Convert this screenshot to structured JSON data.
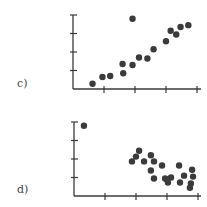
{
  "chart_data": [
    {
      "type": "scatter",
      "panel_label": "c)",
      "title": "",
      "xlabel": "",
      "ylabel": "",
      "grid": false,
      "legend": null,
      "xlim": [
        0,
        4
      ],
      "ylim": [
        0,
        4
      ],
      "x_ticks": [
        1,
        2,
        3,
        4
      ],
      "y_ticks": [
        1,
        2,
        3,
        4
      ],
      "tick_labels_shown": false,
      "points": [
        {
          "x": 0.63,
          "y": 0.28
        },
        {
          "x": 0.95,
          "y": 0.65
        },
        {
          "x": 1.2,
          "y": 0.7
        },
        {
          "x": 1.6,
          "y": 1.35
        },
        {
          "x": 1.62,
          "y": 0.85
        },
        {
          "x": 1.92,
          "y": 1.3
        },
        {
          "x": 1.92,
          "y": 3.8
        },
        {
          "x": 2.13,
          "y": 1.7
        },
        {
          "x": 2.4,
          "y": 1.65
        },
        {
          "x": 2.6,
          "y": 2.15
        },
        {
          "x": 3.0,
          "y": 2.58
        },
        {
          "x": 3.15,
          "y": 3.15
        },
        {
          "x": 3.33,
          "y": 2.95
        },
        {
          "x": 3.47,
          "y": 3.35
        },
        {
          "x": 3.72,
          "y": 3.45
        }
      ],
      "layout": {
        "origin_px": [
          73,
          89
        ],
        "x_unit_px": 31,
        "y_unit_px": 18.5,
        "x_end_px": 201
      }
    },
    {
      "type": "scatter",
      "panel_label": "d)",
      "title": "",
      "xlabel": "",
      "ylabel": "",
      "grid": false,
      "legend": null,
      "xlim": [
        0,
        4
      ],
      "ylim": [
        0,
        4
      ],
      "x_ticks": [
        1,
        2,
        3,
        4
      ],
      "y_ticks": [
        1,
        2,
        3,
        4
      ],
      "tick_labels_shown": false,
      "points": [
        {
          "x": 0.32,
          "y": 3.8
        },
        {
          "x": 1.87,
          "y": 1.87
        },
        {
          "x": 2.0,
          "y": 2.13
        },
        {
          "x": 2.1,
          "y": 2.45
        },
        {
          "x": 2.26,
          "y": 1.87
        },
        {
          "x": 2.48,
          "y": 2.2
        },
        {
          "x": 2.58,
          "y": 1.87
        },
        {
          "x": 2.48,
          "y": 1.38
        },
        {
          "x": 2.58,
          "y": 0.95
        },
        {
          "x": 2.84,
          "y": 1.65
        },
        {
          "x": 2.94,
          "y": 0.95
        },
        {
          "x": 3.03,
          "y": 0.73
        },
        {
          "x": 3.13,
          "y": 1.0
        },
        {
          "x": 3.0,
          "y": 0.9
        },
        {
          "x": 3.39,
          "y": 1.65
        },
        {
          "x": 3.42,
          "y": 0.73
        },
        {
          "x": 3.55,
          "y": 1.1
        },
        {
          "x": 3.81,
          "y": 1.42
        },
        {
          "x": 3.84,
          "y": 1.05
        },
        {
          "x": 3.77,
          "y": 0.68
        },
        {
          "x": 3.74,
          "y": 0.45
        }
      ],
      "layout": {
        "origin_px": [
          74,
          196
        ],
        "x_unit_px": 31,
        "y_unit_px": 18.5,
        "x_end_px": 201
      }
    }
  ],
  "panels": {
    "c_label": "c)",
    "d_label": "d)"
  },
  "colors": {
    "axis": "#3a3a3a",
    "point": "#3b3b3b",
    "label": "#444444",
    "background": "#ffffff"
  }
}
